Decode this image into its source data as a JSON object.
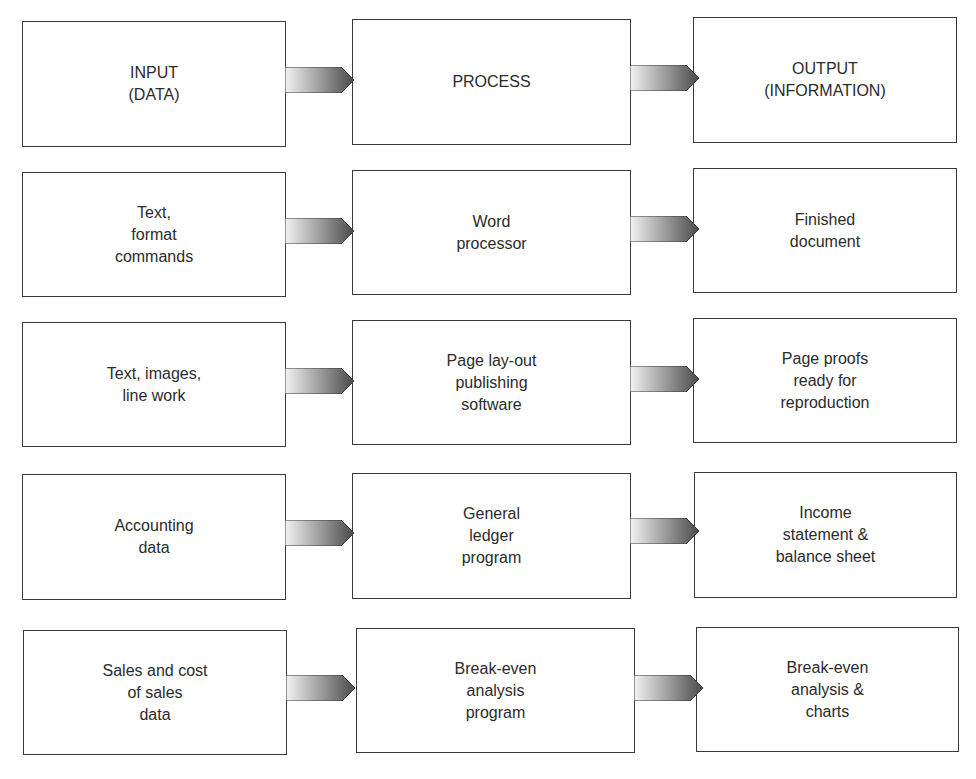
{
  "diagram": {
    "title": "",
    "columns": [
      "input",
      "process",
      "output"
    ],
    "rows": [
      {
        "input": "INPUT\n(DATA)",
        "process": "PROCESS",
        "output": "OUTPUT\n(INFORMATION)"
      },
      {
        "input": "Text,\nformat\ncommands",
        "process": "Word\nprocessor",
        "output": "Finished\ndocument"
      },
      {
        "input": "Text, images,\nline work",
        "process": "Page lay-out\npublishing\nsoftware",
        "output": "Page proofs\nready for\nreproduction"
      },
      {
        "input": "Accounting\ndata",
        "process": "General\nledger\nprogram",
        "output": "Income\nstatement &\nbalance sheet"
      },
      {
        "input": "Sales and cost\nof sales\ndata",
        "process": "Break-even\nanalysis\nprogram",
        "output": "Break-even\nanalysis &\ncharts"
      }
    ],
    "arrow_icon": "gradient-right-arrow-icon",
    "colors": {
      "border": "#3a3a3a",
      "arrow_light": "#f2f2f2",
      "arrow_dark": "#4a4a4a",
      "text": "#2b2b2b"
    }
  }
}
